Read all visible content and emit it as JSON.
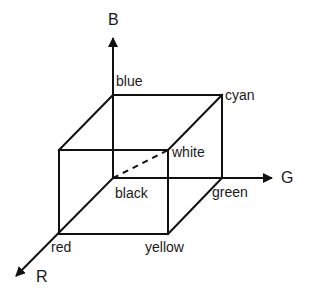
{
  "diagram": {
    "type": "rgb-color-cube",
    "axes": [
      {
        "id": "B",
        "label": "B",
        "from": [
          113,
          178
        ],
        "to": [
          113,
          38
        ]
      },
      {
        "id": "G",
        "label": "G",
        "from": [
          113,
          178
        ],
        "to": [
          272,
          178
        ]
      },
      {
        "id": "R",
        "label": "R",
        "from": [
          113,
          178
        ],
        "to": [
          16,
          276
        ]
      }
    ],
    "vertices": {
      "blue": {
        "label": "blue",
        "pos": [
          113,
          95
        ]
      },
      "cyan": {
        "label": "cyan",
        "pos": [
          222,
          95
        ]
      },
      "top_front_left": {
        "label": "",
        "pos": [
          59,
          150
        ]
      },
      "white": {
        "label": "white",
        "pos": [
          168,
          150
        ]
      },
      "black": {
        "label": "black",
        "pos": [
          113,
          178
        ]
      },
      "green": {
        "label": "green",
        "pos": [
          222,
          178
        ]
      },
      "red": {
        "label": "red",
        "pos": [
          59,
          234
        ]
      },
      "yellow": {
        "label": "yellow",
        "pos": [
          168,
          234
        ]
      }
    },
    "edges_solid": [
      [
        "blue",
        "cyan"
      ],
      [
        "blue",
        "top_front_left"
      ],
      [
        "cyan",
        "white"
      ],
      [
        "top_front_left",
        "white"
      ],
      [
        "cyan",
        "green"
      ],
      [
        "top_front_left",
        "red"
      ],
      [
        "white",
        "yellow"
      ],
      [
        "red",
        "yellow"
      ],
      [
        "yellow",
        "green"
      ]
    ],
    "edges_dashed": [
      [
        "black",
        "white"
      ]
    ],
    "line_color": "#111111",
    "text_color": "#1a1a1a"
  }
}
